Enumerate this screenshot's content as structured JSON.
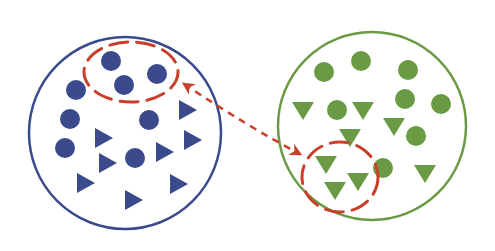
{
  "diagram": {
    "colors": {
      "blue": "#3a4a8c",
      "green": "#6a9a44",
      "red": "#c9402a",
      "background": "#ffffff"
    },
    "groups": [
      {
        "name": "blue-group",
        "center": [
          125,
          133
        ],
        "radius": 96,
        "circles": [
          [
            111,
            61
          ],
          [
            124,
            85
          ],
          [
            157,
            74
          ],
          [
            76,
            90
          ],
          [
            70,
            119
          ],
          [
            149,
            120
          ],
          [
            65,
            148
          ],
          [
            135,
            158
          ]
        ],
        "triangles_right": [
          [
            187,
            110
          ],
          [
            103,
            138
          ],
          [
            192,
            140
          ],
          [
            164,
            152
          ],
          [
            107,
            163
          ],
          [
            85,
            183
          ],
          [
            178,
            184
          ],
          [
            133,
            200
          ]
        ]
      },
      {
        "name": "green-group",
        "center": [
          372,
          126
        ],
        "radius": 94,
        "circles": [
          [
            324,
            72
          ],
          [
            361,
            61
          ],
          [
            408,
            70
          ],
          [
            405,
            99
          ],
          [
            441,
            104
          ],
          [
            337,
            110
          ],
          [
            416,
            136
          ],
          [
            383,
            168
          ]
        ],
        "triangles_down": [
          [
            303,
            110
          ],
          [
            363,
            110
          ],
          [
            394,
            126
          ],
          [
            350,
            137
          ],
          [
            326,
            164
          ],
          [
            358,
            181
          ],
          [
            335,
            190
          ],
          [
            425,
            173
          ]
        ]
      }
    ],
    "highlights": [
      {
        "name": "blue-selection",
        "cx": 131,
        "cy": 72,
        "rx": 47,
        "ry": 30
      },
      {
        "name": "green-selection",
        "cx": 340,
        "cy": 177,
        "rx": 38,
        "ry": 35
      }
    ],
    "arrow": {
      "from": [
        184,
        84
      ],
      "to": [
        300,
        154
      ],
      "bidirectional": true
    }
  }
}
